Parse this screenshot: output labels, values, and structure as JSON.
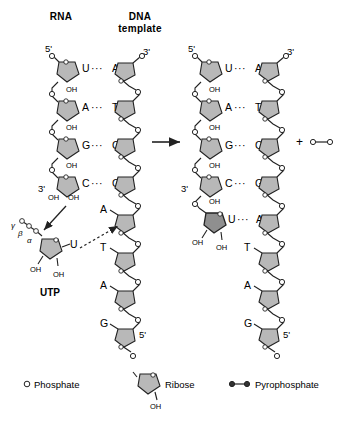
{
  "headers": {
    "rna": "RNA",
    "dna_line1": "DNA",
    "dna_line2": "template"
  },
  "colors": {
    "ribose_fill": "#b8b8b8",
    "ribose_fill_new": "#8f8f8f",
    "stroke": "#222222",
    "phosphate_fill": "#ffffff",
    "text": "#000000",
    "background": "#ffffff"
  },
  "left_structure": {
    "name": "reactants",
    "rna_label_5prime": "5'",
    "rna_label_3prime": "3'",
    "dna_label_3prime": "3'",
    "dna_label_5prime": "5'",
    "base_pairs": [
      {
        "rna": "U",
        "bond": "···",
        "dna": "A"
      },
      {
        "rna": "A",
        "bond": "···",
        "dna": "T"
      },
      {
        "rna": "G",
        "bond": "···",
        "dna": "C"
      },
      {
        "rna": "C",
        "bond": "···",
        "dna": "G"
      }
    ],
    "unpaired_dna_bases": [
      "A",
      "T",
      "A",
      "G"
    ],
    "rna_oh_labels": [
      "OH",
      "OH",
      "OH",
      "OH",
      "OH"
    ],
    "rna_terminal_oh": [
      "OH",
      "OH"
    ]
  },
  "utp": {
    "label": "UTP",
    "base": "U",
    "phosphate_labels": [
      "γ",
      "β",
      "α"
    ],
    "hydroxyls": [
      "OH",
      "OH"
    ],
    "phosphate_count": 3
  },
  "right_structure": {
    "name": "products",
    "rna_label_5prime": "5'",
    "rna_label_3prime": "3'",
    "dna_label_3prime": "3'",
    "dna_label_5prime": "5'",
    "base_pairs": [
      {
        "rna": "U",
        "bond": "···",
        "dna": "A"
      },
      {
        "rna": "A",
        "bond": "···",
        "dna": "T"
      },
      {
        "rna": "G",
        "bond": "···",
        "dna": "C"
      },
      {
        "rna": "C",
        "bond": "···",
        "dna": "G"
      },
      {
        "rna": "U",
        "bond": "···",
        "dna": "A"
      }
    ],
    "unpaired_dna_bases": [
      "T",
      "A",
      "G"
    ],
    "rna_oh_labels": [
      "OH",
      "OH",
      "OH",
      "OH"
    ],
    "rna_terminal_oh": [
      "OH",
      "OH"
    ],
    "new_nucleotide_oh": "OH"
  },
  "reaction": {
    "arrow": "→",
    "plus": "+",
    "byproduct": "pyrophosphate"
  },
  "legend": {
    "items": [
      {
        "icon": "phosphate-circle-icon",
        "label": "Phosphate"
      },
      {
        "icon": "ribose-pentagon-icon",
        "label": "Ribose",
        "sub_label": "OH"
      },
      {
        "icon": "pyrophosphate-icon",
        "label": "Pyrophosphate"
      }
    ]
  }
}
